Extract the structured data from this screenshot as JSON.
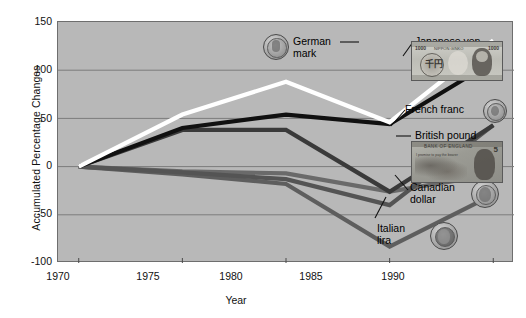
{
  "chart_data": {
    "type": "line",
    "title": "",
    "xlabel": "Year",
    "ylabel": "Accumulated Percentage Changes",
    "x": [
      1970,
      1975,
      1980,
      1985,
      1990
    ],
    "xticklabels": [
      "1970",
      "1975",
      "1980",
      "1985",
      "1990"
    ],
    "yticklabels": [
      "150",
      "100",
      "50",
      "0",
      "-50",
      "-100"
    ],
    "ylim": [
      -100,
      150
    ],
    "xlim": [
      1969,
      1991
    ],
    "grid": true,
    "legend": "right-annotations",
    "series": [
      {
        "name": "Japanese yen",
        "color": "#ffffff",
        "values": [
          0,
          54,
          88,
          46,
          131
        ]
      },
      {
        "name": "German mark",
        "color": "#101010",
        "values": [
          0,
          40,
          54,
          44,
          109
        ]
      },
      {
        "name": "French franc",
        "color": "#3a3a3a",
        "values": [
          0,
          38,
          38,
          -26,
          43
        ]
      },
      {
        "name": "British pound",
        "color": "#545454",
        "values": [
          0,
          -6,
          -13,
          -40,
          43
        ]
      },
      {
        "name": "Canadian dollar",
        "color": "#6a6a6a",
        "values": [
          0,
          -5,
          -7,
          -26,
          -8
        ]
      },
      {
        "name": "Italian lira",
        "color": "#5e5e5e",
        "values": [
          0,
          -8,
          -18,
          -83,
          -29
        ]
      }
    ]
  },
  "annotations": [
    {
      "id": "german-mark",
      "label_line1": "German",
      "label_line2": "mark",
      "icon": "german-mark-coin"
    },
    {
      "id": "japanese-yen",
      "label_line1": "Japanese yen",
      "label_line2": "",
      "icon": "japanese-yen-banknote"
    },
    {
      "id": "french-franc",
      "label_line1": "French franc",
      "label_line2": "",
      "icon": "french-franc-coin"
    },
    {
      "id": "british-pound",
      "label_line1": "British pound",
      "label_line2": "",
      "icon": "british-pound-banknote"
    },
    {
      "id": "canadian-dollar",
      "label_line1": "Canadian",
      "label_line2": "dollar",
      "icon": "canadian-dollar-coin"
    },
    {
      "id": "italian-lira",
      "label_line1": "Italian",
      "label_line2": "lira",
      "icon": "italian-lira-coin"
    }
  ],
  "banknotes": {
    "yen": {
      "denom_left": "1000",
      "denom_right": "1000",
      "kanji": "千円",
      "bank_text": "NIPPON GINKO"
    },
    "gbp": {
      "bank_text": "BANK OF ENGLAND",
      "promise_text": "I promise to pay the bearer",
      "denom": "5"
    }
  },
  "colors": {
    "plot_background": "#b8b8b8",
    "page_background": "#ffffff",
    "gridline": "#7c7c7c",
    "axis": "#4a4a4a",
    "text": "#111111"
  }
}
